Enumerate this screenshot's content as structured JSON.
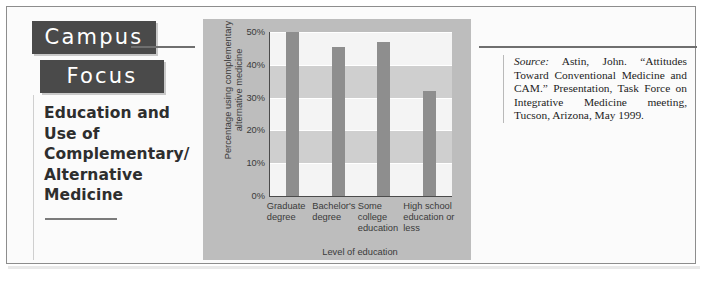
{
  "sidebar": {
    "kicker_line1": "Campus",
    "kicker_line2": "Focus",
    "headline": "Education and Use of Complementary/ Alternative Medicine"
  },
  "source": {
    "label": "Source:",
    "text": " Astin, John. “Attitudes Toward Conventional Medicine and CAM.” Presentation, Task Force on Integrative Medicine meeting, Tucson, Arizona, May 1999."
  },
  "colors": {
    "bar": "#8e8e8e",
    "panel": "#bdbdbd",
    "plot_background": "#f4f4f4",
    "band": "#cfcfcf",
    "kicker_block": "#4a4a4a",
    "axis": "#4b4b4b"
  },
  "chart_data": {
    "type": "bar",
    "title": "",
    "categories": [
      "Graduate degree",
      "Bachelor's degree",
      "Some college education",
      "High school education or less"
    ],
    "values": [
      50,
      45.5,
      47,
      32
    ],
    "xlabel": "Level of education",
    "ylabel": "Percentage using complementary alternative medicine",
    "ylim": [
      0,
      50
    ],
    "ytick_labels": [
      "0%",
      "10%",
      "20%",
      "30%",
      "40%",
      "50%"
    ],
    "ytick_values": [
      0,
      10,
      20,
      30,
      40,
      50
    ],
    "grid": true,
    "legend": "none"
  }
}
